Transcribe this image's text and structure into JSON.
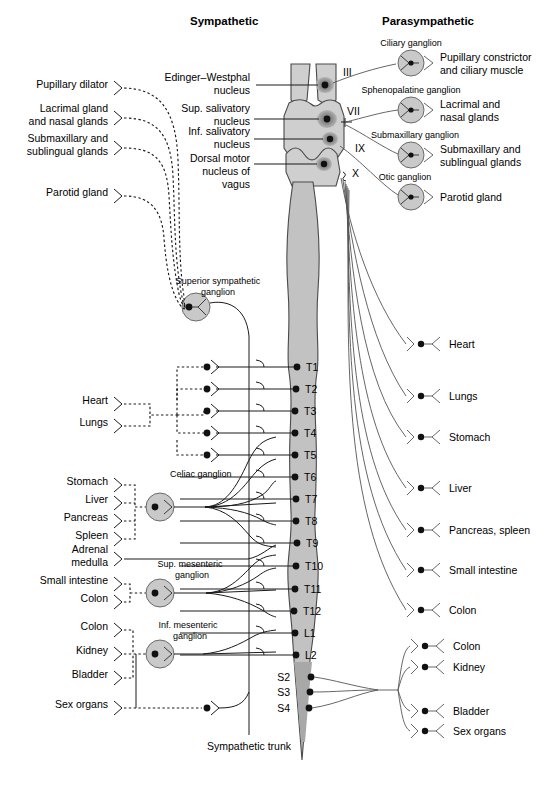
{
  "headers": {
    "left": "Sympathetic",
    "right": "Parasympathetic"
  },
  "brainstem_nuclei": [
    {
      "id": "edinger-westphal",
      "label_line1": "Edinger–Westphal",
      "label_line2": "nucleus"
    },
    {
      "id": "sup-salivatory",
      "label_line1": "Sup. salivatory",
      "label_line2": "nucleus"
    },
    {
      "id": "inf-salivatory",
      "label_line1": "Inf. salivatory",
      "label_line2": "nucleus"
    },
    {
      "id": "dorsal-motor-vagus",
      "label_line1": "Dorsal motor",
      "label_line2": "nucleus of",
      "label_line3": "vagus"
    }
  ],
  "cranial_nerves": [
    {
      "id": "cn3",
      "label": "III"
    },
    {
      "id": "cn7",
      "label": "VII"
    },
    {
      "id": "cn9",
      "label": "IX"
    },
    {
      "id": "cn10",
      "label": "X"
    }
  ],
  "parasympathetic_cranial": [
    {
      "ganglion": "Ciliary ganglion",
      "target_line1": "Pupillary constrictor",
      "target_line2": "and ciliary muscle"
    },
    {
      "ganglion": "Sphenopalatine ganglion",
      "target_line1": "Lacrimal and",
      "target_line2": "nasal glands"
    },
    {
      "ganglion": "Submaxillary ganglion",
      "target_line1": "Submaxillary and",
      "target_line2": "sublingual glands"
    },
    {
      "ganglion": "Otic ganglion",
      "target_line1": "Parotid gland",
      "target_line2": ""
    }
  ],
  "sympathetic_head_targets": [
    {
      "line1": "Pupillary dilator",
      "line2": ""
    },
    {
      "line1": "Lacrimal gland",
      "line2": "and nasal glands"
    },
    {
      "line1": "Submaxillary and",
      "line2": "sublingual glands"
    },
    {
      "line1": "Parotid gland",
      "line2": ""
    }
  ],
  "sympathetic_ganglia": [
    {
      "id": "superior-sympathetic",
      "line1": "Superior sympathetic",
      "line2": "ganglion"
    },
    {
      "id": "celiac",
      "line1": "Celiac ganglion",
      "line2": ""
    },
    {
      "id": "sup-mesenteric",
      "line1": "Sup. mesenteric",
      "line2": "ganglion"
    },
    {
      "id": "inf-mesenteric",
      "line1": "Inf. mesenteric",
      "line2": "ganglion"
    }
  ],
  "sympathetic_thoracic_targets": [
    {
      "label": "Heart"
    },
    {
      "label": "Lungs"
    }
  ],
  "sympathetic_celiac_targets": [
    {
      "label": "Stomach"
    },
    {
      "label": "Liver"
    },
    {
      "label": "Pancreas"
    },
    {
      "label": "Spleen"
    }
  ],
  "sympathetic_adrenal": {
    "line1": "Adrenal",
    "line2": "medulla"
  },
  "sympathetic_supmes_targets": [
    {
      "label": "Small intestine"
    },
    {
      "label": "Colon"
    }
  ],
  "sympathetic_infmes_targets": [
    {
      "label": "Colon"
    },
    {
      "label": "Kidney"
    },
    {
      "label": "Bladder"
    }
  ],
  "sympathetic_sex_organs": {
    "label": "Sex organs"
  },
  "sympathetic_trunk": {
    "label": "Sympathetic trunk"
  },
  "spinal_segments": [
    {
      "label": "T1"
    },
    {
      "label": "T2"
    },
    {
      "label": "T3"
    },
    {
      "label": "T4"
    },
    {
      "label": "T5"
    },
    {
      "label": "T6"
    },
    {
      "label": "T7"
    },
    {
      "label": "T8"
    },
    {
      "label": "T9"
    },
    {
      "label": "T10"
    },
    {
      "label": "T11"
    },
    {
      "label": "T12"
    },
    {
      "label": "L1"
    },
    {
      "label": "L2"
    }
  ],
  "sacral_segments": [
    {
      "label": "S2"
    },
    {
      "label": "S3"
    },
    {
      "label": "S4"
    }
  ],
  "parasympathetic_vagal_targets": [
    {
      "label": "Heart"
    },
    {
      "label": "Lungs"
    },
    {
      "label": "Stomach"
    },
    {
      "label": "Liver"
    },
    {
      "label": "Pancreas, spleen"
    },
    {
      "label": "Small intestine"
    },
    {
      "label": "Colon"
    }
  ],
  "parasympathetic_sacral_targets": [
    {
      "label": "Colon"
    },
    {
      "label": "Kidney"
    },
    {
      "label": "Bladder"
    },
    {
      "label": "Sex organs"
    }
  ],
  "colors": {
    "cord_fill": "#c2c2c2",
    "cord_light": "#cfcfcf",
    "cord_dark": "#a8a8a8",
    "ganglion_fill": "#c9c9c9",
    "nucleus_fill": "#9a9a9a",
    "stroke": "#1a1a1a",
    "background": "#ffffff"
  }
}
